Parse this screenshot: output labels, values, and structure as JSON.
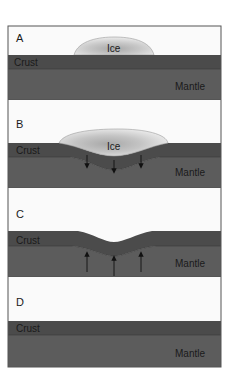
{
  "figure": {
    "colors": {
      "sky": "#fafafa",
      "crust": "#4b4b4b",
      "mantle": "#5c5c5c",
      "ice_outer": "#e4e4e4",
      "ice_inner": "#b8b8b8",
      "frame": "#555555",
      "arrow": "#111111"
    },
    "panels": [
      {
        "letter": "A",
        "crust_label": "Crust",
        "mantle_label": "Mantle",
        "ice_label": "Ice",
        "has_ice": true,
        "arrows": "none",
        "state": "ice forming on flat crust"
      },
      {
        "letter": "B",
        "crust_label": "Crust",
        "mantle_label": "Mantle",
        "ice_label": "Ice",
        "has_ice": true,
        "arrows": "down",
        "state": "ice load depresses crust into mantle"
      },
      {
        "letter": "C",
        "crust_label": "Crust",
        "mantle_label": "Mantle",
        "ice_label": null,
        "has_ice": false,
        "arrows": "up",
        "state": "ice melted; crust rebounds"
      },
      {
        "letter": "D",
        "crust_label": "Crust",
        "mantle_label": "Mantle",
        "ice_label": null,
        "has_ice": false,
        "arrows": "none",
        "state": "crust returned to equilibrium"
      }
    ]
  }
}
